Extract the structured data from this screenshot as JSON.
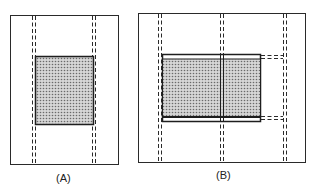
{
  "panels": [
    {
      "id": "A",
      "label": "(A)"
    },
    {
      "id": "B",
      "label": "(B)"
    }
  ],
  "colors": {
    "line": "#2a2a2a",
    "shade": "#bdbdbd",
    "background": "#ffffff"
  }
}
